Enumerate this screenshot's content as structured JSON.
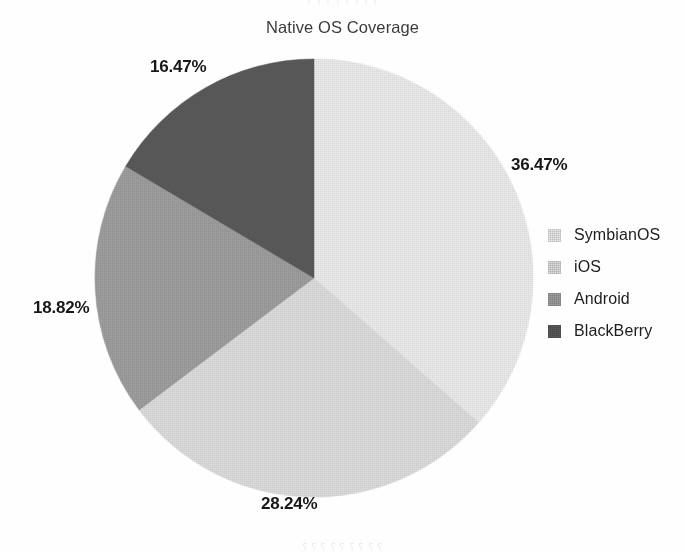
{
  "chart_data": {
    "type": "pie",
    "title": "Native OS Coverage",
    "xlabel": "",
    "ylabel": "",
    "grid": false,
    "legend_position": "right",
    "start_angle_deg": 0,
    "direction": "clockwise",
    "units": "percent",
    "categories": [
      "SymbianOS",
      "iOS",
      "Android",
      "BlackBerry"
    ],
    "values": [
      36.47,
      28.24,
      18.82,
      16.47
    ],
    "data_labels": [
      "36.47%",
      "28.24%",
      "18.82%",
      "16.47%"
    ],
    "colors": [
      "#ebebeb",
      "#dcdcdc",
      "#9e9e9e",
      "#5a5a5a"
    ],
    "slices": [
      {
        "label": "SymbianOS",
        "value": 36.47,
        "data_label": "36.47%",
        "color": "#ebebeb"
      },
      {
        "label": "iOS",
        "value": 28.24,
        "data_label": "28.24%",
        "color": "#dcdcdc"
      },
      {
        "label": "Android",
        "value": 18.82,
        "data_label": "18.82%",
        "color": "#9e9e9e"
      },
      {
        "label": "BlackBerry",
        "value": 16.47,
        "data_label": "16.47%",
        "color": "#5a5a5a"
      }
    ],
    "total": 100.0
  },
  "title": "Native OS Coverage",
  "labels": {
    "symbianos_pct": "36.47%",
    "ios_pct": "28.24%",
    "android_pct": "18.82%",
    "blackberry_pct": "16.47%"
  },
  "legend": {
    "items": [
      {
        "label": "SymbianOS",
        "color": "#ebebeb"
      },
      {
        "label": "iOS",
        "color": "#dcdcdc"
      },
      {
        "label": "Android",
        "color": "#9e9e9e"
      },
      {
        "label": "BlackBerry",
        "color": "#5a5a5a"
      }
    ]
  },
  "artifacts": {
    "top": "⸮ ⸮   ⸮  ⸮  ⸮ ⸮  ⸮  ⸮",
    "bottom": "⸮ ⸮  ⸮   ⸮  ⸮ ⸮   ⸮  ⸮  ⸮"
  }
}
